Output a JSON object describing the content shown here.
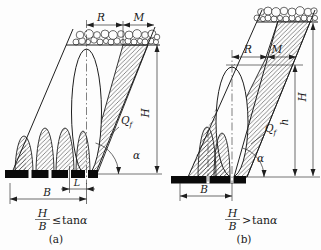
{
  "figure_a": {
    "dim_R": "R",
    "dim_M": "M",
    "dim_H": "H",
    "dim_B": "B",
    "dim_L": "L",
    "label_Q": "Q",
    "label_Q_sub": "f",
    "label_alpha": "α",
    "formula": {
      "numerator": "H",
      "denominator": "B",
      "relation": "≤",
      "fn": "tan",
      "fn_arg": "α"
    },
    "caption": "(a)"
  },
  "figure_b": {
    "dim_R": "R",
    "dim_M": "M",
    "dim_H": "H",
    "dim_h": "h",
    "dim_B": "B",
    "label_Q": "Q",
    "label_Q_sub": "f",
    "label_alpha": "α",
    "formula": {
      "numerator": "H",
      "denominator": "B",
      "relation": ">",
      "fn": "tan",
      "fn_arg": "α"
    },
    "caption": "(b)"
  },
  "colors": {
    "line": "#1f1f1f",
    "background": "#fdfdfd",
    "bar": "#0a0a0a"
  }
}
